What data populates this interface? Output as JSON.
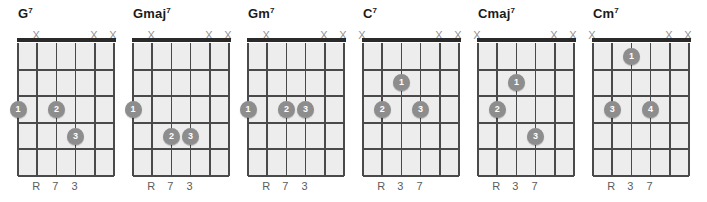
{
  "diagram": {
    "type": "guitar-chord-chart",
    "string_count": 6,
    "fret_count": 5,
    "muted_marker": "X",
    "colors": {
      "grid_background": "#ededed",
      "line": "#4a4a4a",
      "nut": "#2a2a2a",
      "dot": "#8d8d8d",
      "dot_text": "#ffffff",
      "title": "#1b1b1b",
      "marker": "#909090",
      "label": "#5b5b5b"
    },
    "chords": [
      {
        "name": "G",
        "quality_superscript": "7",
        "muted_strings": [
          1,
          4,
          5
        ],
        "interval_labels": [
          {
            "string": 1,
            "text": "R"
          },
          {
            "string": 2,
            "text": "7"
          },
          {
            "string": 3,
            "text": "3"
          }
        ],
        "dots": [
          {
            "string": 0,
            "fret": 3,
            "finger": "1"
          },
          {
            "string": 2,
            "fret": 3,
            "finger": "2"
          },
          {
            "string": 3,
            "fret": 4,
            "finger": "3"
          }
        ]
      },
      {
        "name": "Gmaj",
        "quality_superscript": "7",
        "muted_strings": [
          1,
          4,
          5
        ],
        "interval_labels": [
          {
            "string": 1,
            "text": "R"
          },
          {
            "string": 2,
            "text": "7"
          },
          {
            "string": 3,
            "text": "3"
          }
        ],
        "dots": [
          {
            "string": 0,
            "fret": 3,
            "finger": "1"
          },
          {
            "string": 2,
            "fret": 4,
            "finger": "2"
          },
          {
            "string": 3,
            "fret": 4,
            "finger": "3"
          }
        ]
      },
      {
        "name": "Gm",
        "quality_superscript": "7",
        "muted_strings": [
          1,
          4,
          5
        ],
        "interval_labels": [
          {
            "string": 1,
            "text": "R"
          },
          {
            "string": 2,
            "text": "7"
          },
          {
            "string": 3,
            "text": "3"
          }
        ],
        "dots": [
          {
            "string": 0,
            "fret": 3,
            "finger": "1"
          },
          {
            "string": 2,
            "fret": 3,
            "finger": "2"
          },
          {
            "string": 3,
            "fret": 3,
            "finger": "3"
          }
        ]
      },
      {
        "name": "C",
        "quality_superscript": "7",
        "muted_strings": [
          0,
          4,
          5
        ],
        "interval_labels": [
          {
            "string": 1,
            "text": "R"
          },
          {
            "string": 2,
            "text": "3"
          },
          {
            "string": 3,
            "text": "7"
          }
        ],
        "dots": [
          {
            "string": 2,
            "fret": 2,
            "finger": "1"
          },
          {
            "string": 1,
            "fret": 3,
            "finger": "2"
          },
          {
            "string": 3,
            "fret": 3,
            "finger": "3"
          }
        ]
      },
      {
        "name": "Cmaj",
        "quality_superscript": "7",
        "muted_strings": [
          0,
          4,
          5
        ],
        "interval_labels": [
          {
            "string": 1,
            "text": "R"
          },
          {
            "string": 2,
            "text": "3"
          },
          {
            "string": 3,
            "text": "7"
          }
        ],
        "dots": [
          {
            "string": 2,
            "fret": 2,
            "finger": "1"
          },
          {
            "string": 1,
            "fret": 3,
            "finger": "2"
          },
          {
            "string": 3,
            "fret": 4,
            "finger": "3"
          }
        ]
      },
      {
        "name": "Cm",
        "quality_superscript": "7",
        "muted_strings": [
          0,
          4,
          5
        ],
        "interval_labels": [
          {
            "string": 1,
            "text": "R"
          },
          {
            "string": 2,
            "text": "3"
          },
          {
            "string": 3,
            "text": "7"
          }
        ],
        "dots": [
          {
            "string": 2,
            "fret": 1,
            "finger": "1"
          },
          {
            "string": 1,
            "fret": 3,
            "finger": "3"
          },
          {
            "string": 3,
            "fret": 3,
            "finger": "4"
          }
        ]
      }
    ]
  }
}
